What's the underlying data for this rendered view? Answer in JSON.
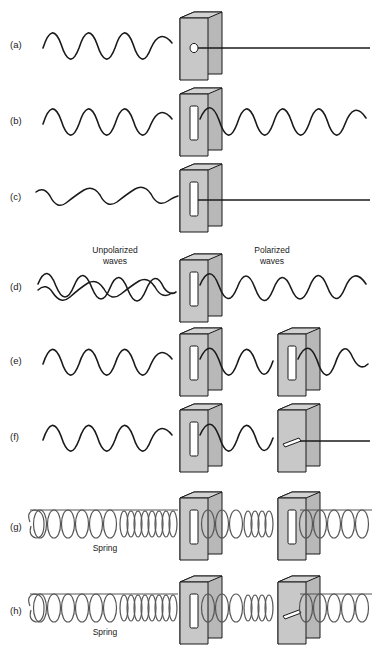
{
  "figure": {
    "background_color": "#ffffff",
    "ink_color": "#1a1a1a",
    "plate_face_color": "#c8c8c8",
    "plate_edge_color": "#9a9a9a",
    "plate_side_color": "#b0b0b0",
    "slit_fill_color": "#ffffff"
  },
  "annotations": {
    "unpolarized_line1": "Unpolarized",
    "unpolarized_line2": "waves",
    "polarized_line1": "Polarized",
    "polarized_line2": "waves",
    "spring_g": "Spring",
    "spring_h": "Spring"
  },
  "panels": [
    {
      "id": "a",
      "label": "(a)",
      "incoming_wave": "transverse-vertical",
      "outgoing_wave": "straight-line",
      "barriers": [
        {
          "aperture": "round-hole"
        }
      ],
      "result": "blocked"
    },
    {
      "id": "b",
      "label": "(b)",
      "incoming_wave": "transverse-vertical",
      "outgoing_wave": "transverse-vertical",
      "barriers": [
        {
          "aperture": "vertical-slit"
        }
      ],
      "result": "transmitted"
    },
    {
      "id": "c",
      "label": "(c)",
      "incoming_wave": "transverse-horizontal",
      "outgoing_wave": "straight-line",
      "barriers": [
        {
          "aperture": "vertical-slit"
        }
      ],
      "result": "blocked"
    },
    {
      "id": "d",
      "label": "(d)",
      "incoming_wave": "unpolarized-crossed",
      "outgoing_wave": "transverse-vertical",
      "barriers": [
        {
          "aperture": "vertical-slit"
        }
      ],
      "result": "polarized"
    },
    {
      "id": "e",
      "label": "(e)",
      "incoming_wave": "transverse-vertical",
      "outgoing_wave": "transverse-vertical",
      "barriers": [
        {
          "aperture": "vertical-slit"
        },
        {
          "aperture": "vertical-slit"
        }
      ],
      "result": "transmitted"
    },
    {
      "id": "f",
      "label": "(f)",
      "incoming_wave": "transverse-vertical",
      "outgoing_wave": "straight-line",
      "barriers": [
        {
          "aperture": "vertical-slit"
        },
        {
          "aperture": "horizontal-slit"
        }
      ],
      "result": "blocked"
    },
    {
      "id": "g",
      "label": "(g)",
      "incoming_wave": "longitudinal-spring",
      "outgoing_wave": "longitudinal-spring",
      "barriers": [
        {
          "aperture": "vertical-slit"
        },
        {
          "aperture": "vertical-slit"
        }
      ],
      "result": "transmitted"
    },
    {
      "id": "h",
      "label": "(h)",
      "incoming_wave": "longitudinal-spring",
      "outgoing_wave": "longitudinal-spring",
      "barriers": [
        {
          "aperture": "vertical-slit"
        },
        {
          "aperture": "horizontal-slit"
        }
      ],
      "result": "transmitted"
    }
  ]
}
